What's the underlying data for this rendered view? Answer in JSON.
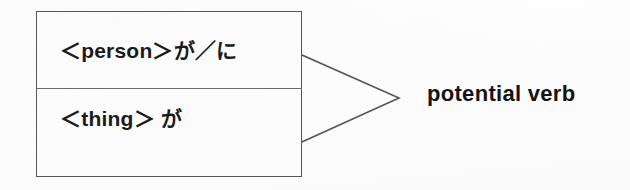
{
  "figure": {
    "background_color": "#fdfdfd",
    "line_color": "#565656",
    "text_color": "#1b1b1b"
  },
  "pattern_box": {
    "rows": [
      {
        "id": "person-row",
        "text": "＜person＞が／に",
        "slot": "person",
        "particles": "が／に"
      },
      {
        "id": "thing-row",
        "text": "＜thing＞ が",
        "slot": "thing",
        "particles": "が"
      }
    ]
  },
  "connector": {
    "icon": "converging-bracket-icon",
    "shape": "chevron-right",
    "from_rows": 2,
    "to_targets": 1
  },
  "result": {
    "label": "potential verb"
  }
}
